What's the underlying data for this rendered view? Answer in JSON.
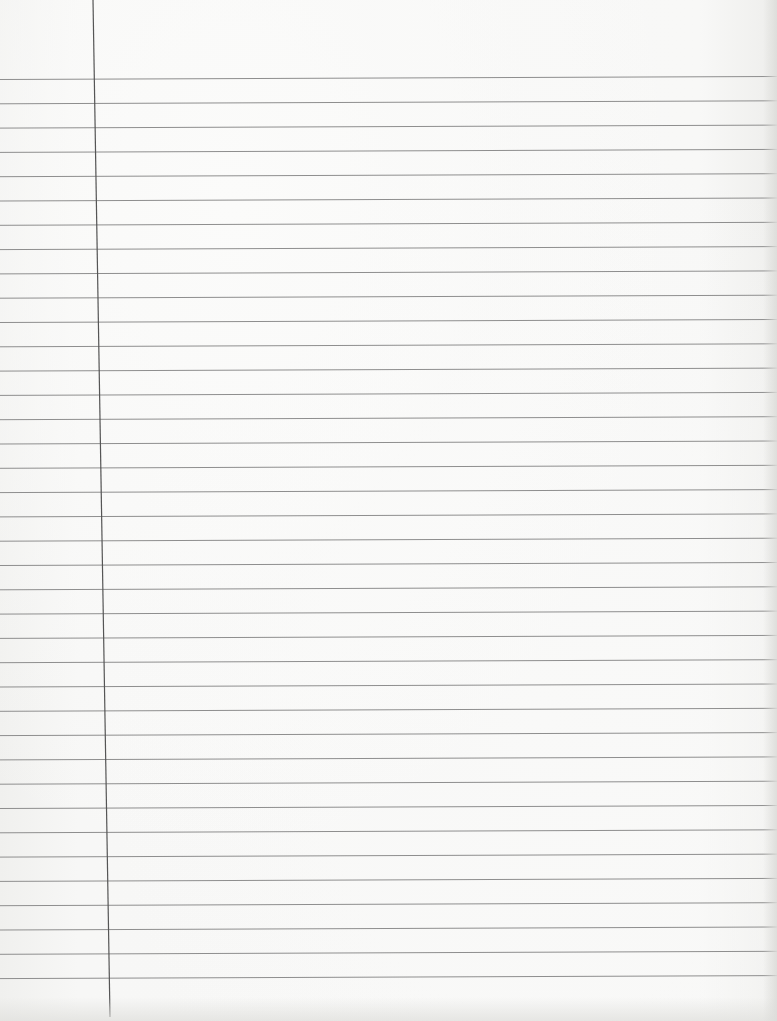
{
  "document": {
    "type": "ruled-notebook-paper",
    "content_text": "",
    "width": 777,
    "height": 1021
  },
  "rules": {
    "count": 38,
    "first_y": 78,
    "spacing": 24.3,
    "color": "#8e8e8e",
    "stroke_width": 1
  },
  "margin_line": {
    "x_top": 93,
    "x_bottom": 110,
    "color": "#555555",
    "stroke_width": 1.2
  },
  "colors": {
    "paper": "#f6f6f5",
    "shadow": "#e0e0dd"
  }
}
